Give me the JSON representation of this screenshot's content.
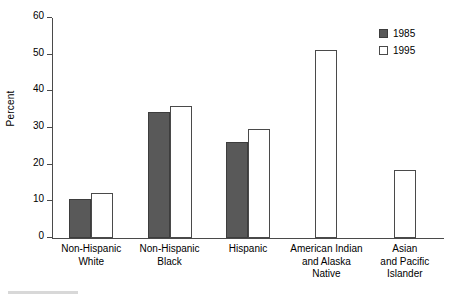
{
  "chart_data": {
    "type": "bar",
    "title": "",
    "subtitle": "",
    "xlabel": "",
    "ylabel": "Percent",
    "ylim": [
      0,
      60
    ],
    "yticks": [
      0,
      10,
      20,
      30,
      40,
      50,
      60
    ],
    "ytick_labels": [
      "0",
      "10",
      "20",
      "30",
      "40",
      "50",
      "60"
    ],
    "grid": false,
    "legend_position": "top-right",
    "categories": [
      "Non-Hispanic\nWhite",
      "Non-Hispanic\nBlack",
      "Hispanic",
      "American Indian\nand Alaska\nNative",
      "Asian\nand Pacific\nIslander"
    ],
    "series": [
      {
        "name": "1985",
        "style": "filled",
        "color": "#595959",
        "values": [
          10.6,
          34.3,
          26.3,
          null,
          null
        ]
      },
      {
        "name": "1995",
        "style": "hollow",
        "color": "#ffffff",
        "values": [
          12.3,
          36.1,
          29.8,
          51.3,
          18.5
        ]
      }
    ]
  },
  "legend": {
    "items": [
      {
        "label": "1985",
        "style": "filled"
      },
      {
        "label": "1995",
        "style": "hollow"
      }
    ]
  },
  "colors": {
    "bar_1985_fill": "#595959",
    "bar_1995_fill": "#ffffff",
    "bar_outline": "#4a4a4a",
    "axis": "#4a4a4a",
    "background": "#ffffff",
    "text": "#000000"
  }
}
